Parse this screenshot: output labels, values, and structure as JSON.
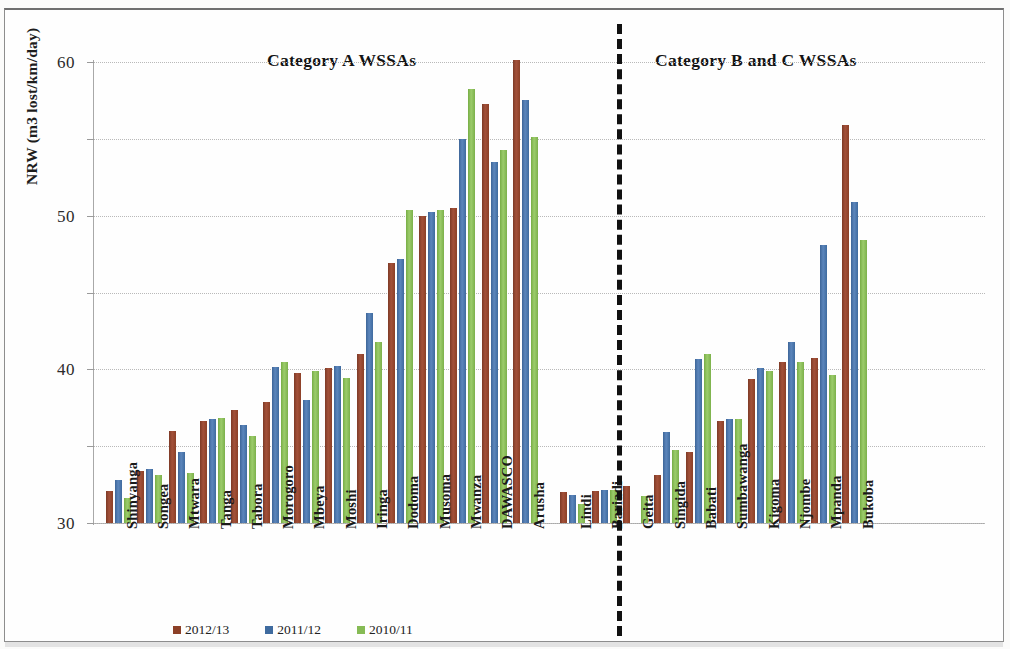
{
  "chart_data": {
    "type": "bar",
    "title": "",
    "xlabel": "",
    "ylabel": "NRW (m3 lost/km/day)",
    "ylim": [
      0,
      60
    ],
    "yticks": [
      0,
      10,
      20,
      30,
      40,
      50,
      60
    ],
    "grid": true,
    "legend_position": "bottom",
    "categories": [
      "Shinyanga",
      "Songea",
      "Mtwara",
      "Tanga",
      "Tabora",
      "Morogoro",
      "Mbeya",
      "Moshi",
      "Iringa",
      "Dodoma",
      "Musoma",
      "Mwanza",
      "DAWASCO",
      "Arusha",
      "Lindi",
      "Bariadi",
      "Geita",
      "Singida",
      "Babati",
      "Sumbawanga",
      "Kigoma",
      "Njombe",
      "Mpanda",
      "Bukoba"
    ],
    "series": [
      {
        "name": "2012/13",
        "color": "#8c4027",
        "values": [
          4.2,
          6.8,
          12.0,
          13.3,
          14.7,
          15.8,
          19.5,
          20.2,
          22.0,
          33.8,
          40.0,
          41.0,
          54.5,
          60.3,
          4.0,
          4.2,
          4.8,
          6.3,
          9.2,
          13.3,
          18.7,
          21.0,
          21.5,
          51.8
        ]
      },
      {
        "name": "2011/12",
        "color": "#3f6b9f",
        "values": [
          5.6,
          7.0,
          9.3,
          13.6,
          12.8,
          20.3,
          16.0,
          20.5,
          27.3,
          34.3,
          40.5,
          50.0,
          47.0,
          55.0,
          3.6,
          4.3,
          0.0,
          11.8,
          21.3,
          13.5,
          20.2,
          23.5,
          36.2,
          41.8
        ]
      },
      {
        "name": "2010/11",
        "color": "#86bb55",
        "values": [
          3.3,
          6.2,
          6.5,
          13.7,
          11.3,
          21.0,
          19.8,
          18.9,
          23.5,
          40.8,
          40.8,
          56.5,
          48.5,
          50.3,
          2.5,
          4.3,
          3.5,
          9.5,
          22.0,
          13.5,
          19.8,
          21.0,
          19.2,
          36.8
        ]
      }
    ],
    "annotations": [
      {
        "text": "Category  A WSSAs",
        "position": "left-top"
      },
      {
        "text": "Category B and C WSSAs",
        "position": "right-top"
      }
    ],
    "divider": {
      "style": "dashed",
      "after_category": "Arusha"
    }
  }
}
